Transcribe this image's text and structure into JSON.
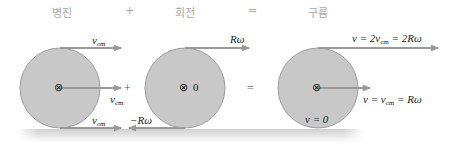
{
  "header": {
    "translation": "병진",
    "plus": "+",
    "rotation": "회전",
    "equals": "=",
    "rolling": "구름"
  },
  "colors": {
    "disk_fill": "#c8c8c8",
    "disk_stroke": "#8a8a8a",
    "arrow": "#9a9a9a",
    "ground": "#d6d6d6",
    "label_text": "#222222",
    "header_text": "#a8a8a8"
  },
  "panels": {
    "translation": {
      "top_label_v": "v",
      "top_label_sub": "cm",
      "center_label_v": "v",
      "center_label_sub": "cm",
      "bottom_label_v": "v",
      "bottom_label_sub": "cm",
      "plus_sign": "+",
      "axis_symbol": "⊗"
    },
    "rotation": {
      "top_label": "Rω",
      "bottom_label": "−Rω",
      "center_symbol": "⊗",
      "center_value": "0",
      "equals_sign": "="
    },
    "rolling": {
      "top_label_pre": "v = 2v",
      "top_label_sub": "cm",
      "top_label_post": " = 2Rω",
      "center_label_pre": "v = v",
      "center_label_sub": "cm",
      "center_label_post": " = Rω",
      "bottom_label": "v = 0",
      "axis_symbol": "⊗"
    }
  }
}
